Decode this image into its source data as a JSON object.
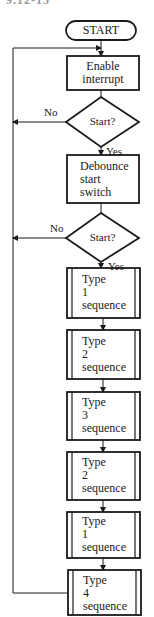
{
  "figure": {
    "label_partial": "9.12-15"
  },
  "nodes": [
    {
      "id": "start",
      "type": "terminal",
      "text": "START"
    },
    {
      "id": "enable_interrupt",
      "type": "process",
      "lines": [
        "Enable",
        "interrupt"
      ]
    },
    {
      "id": "decision_1",
      "type": "decision",
      "text": "Start?",
      "no_label": "No",
      "yes_label": "Yes"
    },
    {
      "id": "debounce",
      "type": "process",
      "lines": [
        "Debounce",
        "start",
        "switch"
      ]
    },
    {
      "id": "decision_2",
      "type": "decision",
      "text": "Start?",
      "no_label": "No",
      "yes_label": "Yes"
    },
    {
      "id": "type1_seq_a",
      "type": "predefined",
      "lines": [
        "Type",
        "1",
        "sequence"
      ]
    },
    {
      "id": "type2_seq_a",
      "type": "predefined",
      "lines": [
        "Type",
        "2",
        "sequence"
      ]
    },
    {
      "id": "type3_seq",
      "type": "predefined",
      "lines": [
        "Type",
        "3",
        "sequence"
      ]
    },
    {
      "id": "type2_seq_b",
      "type": "predefined",
      "lines": [
        "Type",
        "2",
        "sequence"
      ]
    },
    {
      "id": "type1_seq_b",
      "type": "predefined",
      "lines": [
        "Type",
        "1",
        "sequence"
      ]
    },
    {
      "id": "type4_seq",
      "type": "predefined",
      "lines": [
        "Type",
        "4",
        "sequence"
      ]
    }
  ],
  "edges": [
    {
      "from": "start",
      "to": "enable_interrupt"
    },
    {
      "from": "enable_interrupt",
      "to": "decision_1"
    },
    {
      "from": "decision_1",
      "to": "debounce",
      "label": "Yes"
    },
    {
      "from": "decision_1",
      "to": "loop_back_line",
      "label": "No"
    },
    {
      "from": "debounce",
      "to": "decision_2"
    },
    {
      "from": "decision_2",
      "to": "type1_seq_a",
      "label": "Yes"
    },
    {
      "from": "decision_2",
      "to": "loop_back_line",
      "label": "No"
    },
    {
      "from": "type1_seq_a",
      "to": "type2_seq_a"
    },
    {
      "from": "type2_seq_a",
      "to": "type3_seq"
    },
    {
      "from": "type3_seq",
      "to": "type2_seq_b"
    },
    {
      "from": "type2_seq_b",
      "to": "type1_seq_b"
    },
    {
      "from": "type1_seq_b",
      "to": "type4_seq"
    },
    {
      "from": "type4_seq",
      "to": "enable_interrupt",
      "label": ""
    }
  ],
  "colors": {
    "stroke": "#1a1a1a",
    "background": "#ffffff"
  }
}
